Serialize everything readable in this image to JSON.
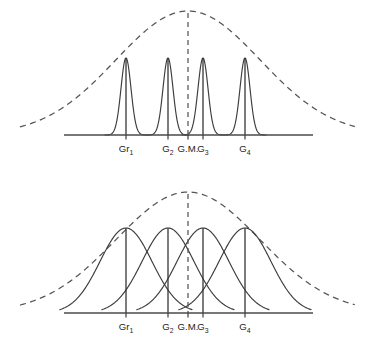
{
  "figure": {
    "title": "",
    "background_color": "#ffffff",
    "stroke_color": "#3c3c3c",
    "dashed_color": "#555555",
    "axis_color": "#4a4a4a",
    "width": 375,
    "height": 346
  },
  "panels": [
    {
      "id": "top-panel",
      "name": "low-within-group-variance",
      "baseline_y": 135,
      "baseline_x_start": 64,
      "baseline_x_end": 313,
      "curve_kind": "narrow-peaks",
      "envelope": {
        "kind": "dashed-normal-curve",
        "peak_x": 188,
        "peak_y": 11,
        "left_x": 20,
        "right_x": 355,
        "sigma": 72
      },
      "center_line": {
        "label": "G.M.",
        "x": 188,
        "y_top": 13,
        "y_bottom": 135
      },
      "groups": [
        {
          "label": "Gr",
          "sub": "1",
          "x": 126,
          "peak_y": 58,
          "sigma": 5.0
        },
        {
          "label": "G",
          "sub": "2",
          "x": 168,
          "peak_y": 58,
          "sigma": 5.0
        },
        {
          "label": "G",
          "sub": "3",
          "x": 203,
          "peak_y": 58,
          "sigma": 5.0
        },
        {
          "label": "G",
          "sub": "4",
          "x": 245,
          "peak_y": 58,
          "sigma": 5.0
        }
      ],
      "ticks": [
        {
          "x": 126,
          "label": "Gr",
          "sub": "1"
        },
        {
          "x": 168,
          "label": "G",
          "sub": "2"
        },
        {
          "x": 188,
          "label": "G.M.",
          "sub": ""
        },
        {
          "x": 203,
          "label": "G",
          "sub": "3"
        },
        {
          "x": 245,
          "label": "G",
          "sub": "4"
        }
      ],
      "tick_label_y": 152
    },
    {
      "id": "bottom-panel",
      "name": "high-within-group-variance",
      "baseline_y": 313,
      "baseline_x_start": 64,
      "baseline_x_end": 313,
      "curve_kind": "wide-overlapping",
      "envelope": {
        "kind": "dashed-normal-curve",
        "peak_x": 188,
        "peak_y": 192,
        "left_x": 20,
        "right_x": 355,
        "sigma": 72
      },
      "center_line": {
        "label": "G.M.",
        "x": 188,
        "y_top": 194,
        "y_bottom": 313
      },
      "groups": [
        {
          "label": "Gr",
          "sub": "1",
          "x": 126,
          "peak_y": 228,
          "sigma": 26
        },
        {
          "label": "G",
          "sub": "2",
          "x": 168,
          "peak_y": 228,
          "sigma": 26
        },
        {
          "label": "G",
          "sub": "3",
          "x": 203,
          "peak_y": 228,
          "sigma": 26
        },
        {
          "label": "G",
          "sub": "4",
          "x": 245,
          "peak_y": 228,
          "sigma": 26
        }
      ],
      "ticks": [
        {
          "x": 126,
          "label": "Gr",
          "sub": "1"
        },
        {
          "x": 168,
          "label": "G",
          "sub": "2"
        },
        {
          "x": 188,
          "label": "G.M.",
          "sub": ""
        },
        {
          "x": 203,
          "label": "G",
          "sub": "3"
        },
        {
          "x": 245,
          "label": "G",
          "sub": "4"
        }
      ],
      "tick_label_y": 330
    }
  ],
  "chart_data": {
    "type": "line",
    "title": "",
    "xlabel": "",
    "ylabel": "",
    "categories": [
      "Gr1",
      "G2",
      "G.M.",
      "G3",
      "G4"
    ],
    "series": [
      {
        "name": "top-panel-group-curves",
        "kind": "narrow-normal-curves",
        "means": [
          126,
          168,
          203,
          245
        ],
        "sigma": 5.0,
        "peak_height": 77,
        "baseline": 135
      },
      {
        "name": "top-panel-envelope",
        "kind": "dashed-total-distribution",
        "mean": 188,
        "sigma": 72,
        "peak_height": 124,
        "baseline": 135
      },
      {
        "name": "bottom-panel-group-curves",
        "kind": "wide-normal-curves",
        "means": [
          126,
          168,
          203,
          245
        ],
        "sigma": 26,
        "peak_height": 85,
        "baseline": 313
      },
      {
        "name": "bottom-panel-envelope",
        "kind": "dashed-total-distribution",
        "mean": 188,
        "sigma": 72,
        "peak_height": 121,
        "baseline": 313
      }
    ],
    "grand_mean_label": "G.M.",
    "grand_mean_x": 188,
    "grid": false,
    "legend": "none"
  }
}
